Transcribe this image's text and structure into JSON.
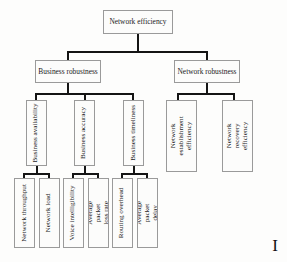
{
  "diagram": {
    "title": "Network efficiency",
    "corner_mark": "I",
    "colors": {
      "background": "#fdfdfc",
      "box_fill": "#fcfcfb",
      "box_border": "#9a9a9a",
      "connector": "#141414",
      "text": "#1b1b1b"
    },
    "levels": {
      "root": {
        "label": "Network efficiency"
      },
      "level2": [
        {
          "id": "business-robustness",
          "label": "Business robustness"
        },
        {
          "id": "network-robustness",
          "label": "Network robustness"
        }
      ],
      "level3": [
        {
          "id": "business-availability",
          "label": "Business availability",
          "parent": "business-robustness"
        },
        {
          "id": "business-accuracy",
          "label": "Business accuracy",
          "parent": "business-robustness"
        },
        {
          "id": "business-timeliness",
          "label": "Business timeliness",
          "parent": "business-robustness"
        },
        {
          "id": "network-establishment-efficiency",
          "label": "Network establishment efficiency",
          "parent": "network-robustness"
        },
        {
          "id": "network-recovery-efficiency",
          "label": "Network recovery efficiency",
          "parent": "network-robustness"
        }
      ],
      "level4": [
        {
          "id": "network-throughput",
          "label": "Network throughput",
          "parent": "business-availability"
        },
        {
          "id": "network-load",
          "label": "Network load",
          "parent": "business-availability"
        },
        {
          "id": "voice-intelligibility",
          "label": "Voice intelligibility",
          "parent": "business-accuracy"
        },
        {
          "id": "average-packet-loss-rate",
          "label": "Average packet loss rate",
          "parent": "business-accuracy"
        },
        {
          "id": "routing-overhead",
          "label": "Routing overhead",
          "parent": "business-timeliness"
        },
        {
          "id": "average-packet-delay",
          "label": "Average packet delay",
          "parent": "business-timeliness"
        }
      ]
    }
  }
}
